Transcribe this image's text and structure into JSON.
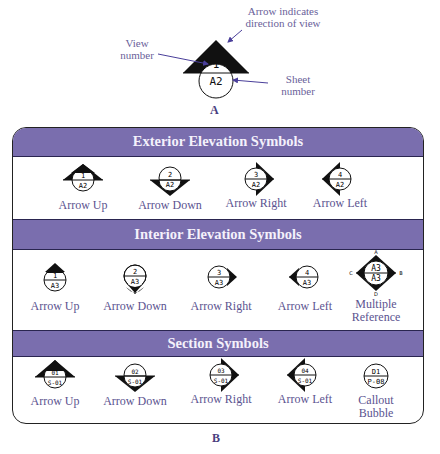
{
  "figure_a": {
    "caption": "A",
    "view_number": "1",
    "sheet_number": "A2",
    "annotations": {
      "arrow_note_line1": "Arrow indicates",
      "arrow_note_line2": "direction of view",
      "view_number_line1": "View",
      "view_number_line2": "number",
      "sheet_number_line1": "Sheet",
      "sheet_number_line2": "number"
    }
  },
  "figure_b": {
    "caption": "B",
    "colors": {
      "header_bg": "#7a6eae",
      "header_text": "#f4f1fb",
      "label_text": "#5b5390"
    },
    "sections": [
      {
        "title": "Exterior Elevation Symbols",
        "items": [
          {
            "label": "Arrow Up",
            "top": "1",
            "bottom": "A2",
            "arrow": "up"
          },
          {
            "label": "Arrow Down",
            "top": "2",
            "bottom": "A2",
            "arrow": "down"
          },
          {
            "label": "Arrow Right",
            "top": "3",
            "bottom": "A2",
            "arrow": "right"
          },
          {
            "label": "Arrow Left",
            "top": "4",
            "bottom": "A2",
            "arrow": "left"
          }
        ]
      },
      {
        "title": "Interior Elevation Symbols",
        "items": [
          {
            "label": "Arrow Up",
            "top": "1",
            "bottom": "A3",
            "arrow": "up"
          },
          {
            "label": "Arrow Down",
            "top": "2",
            "bottom": "A3",
            "arrow": "down"
          },
          {
            "label": "Arrow Right",
            "top": "3",
            "bottom": "A3",
            "arrow": "right"
          },
          {
            "label": "Arrow Left",
            "top": "4",
            "bottom": "A3",
            "arrow": "left"
          },
          {
            "label_line1": "Multiple",
            "label_line2": "Reference",
            "top": "A3",
            "bottom": "A3",
            "arrow": "all",
            "letters": {
              "top": "A",
              "right": "B",
              "bottom": "D",
              "left": "C"
            }
          }
        ]
      },
      {
        "title": "Section Symbols",
        "items": [
          {
            "label": "Arrow Up",
            "top": "01",
            "bottom": "S-01",
            "arrow": "up"
          },
          {
            "label": "Arrow Down",
            "top": "02",
            "bottom": "S-01",
            "arrow": "down"
          },
          {
            "label": "Arrow Right",
            "top": "03",
            "bottom": "S-01",
            "arrow": "right"
          },
          {
            "label": "Arrow Left",
            "top": "04",
            "bottom": "S-01",
            "arrow": "left"
          },
          {
            "label_line1": "Callout",
            "label_line2": "Bubble",
            "top": "D1",
            "bottom": "P-08",
            "arrow": "none"
          }
        ]
      }
    ]
  }
}
